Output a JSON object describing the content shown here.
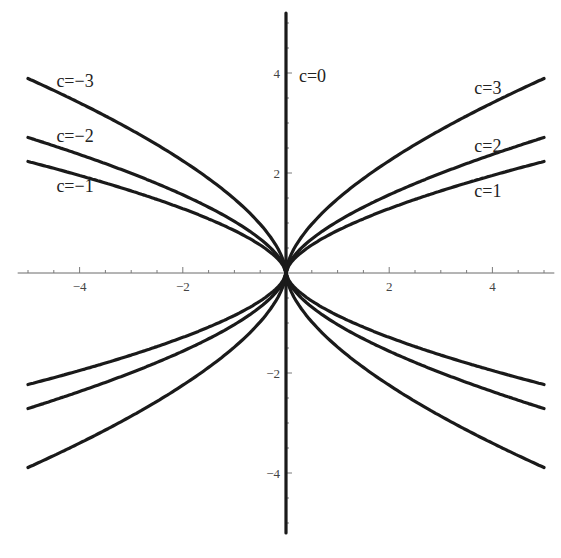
{
  "chart_data": {
    "type": "line",
    "title": "",
    "xlabel": "",
    "ylabel": "",
    "xlim": [
      -5.2,
      5.2
    ],
    "ylim": [
      -5.2,
      5.3
    ],
    "grid": false,
    "legend": "inline labels",
    "x_ticks": [
      {
        "value": -4,
        "label": "−4"
      },
      {
        "value": -2,
        "label": "−2"
      },
      {
        "value": 2,
        "label": "2"
      },
      {
        "value": 4,
        "label": "4"
      }
    ],
    "y_ticks": [
      {
        "value": 4,
        "label": "4"
      },
      {
        "value": 2,
        "label": "2"
      },
      {
        "value": -2,
        "label": "−2"
      },
      {
        "value": -4,
        "label": "−4"
      }
    ],
    "minor_tick_step": 0.5,
    "x_sample": [
      0,
      0.1,
      0.25,
      0.5,
      1,
      1.5,
      2,
      3,
      4,
      5
    ],
    "series": [
      {
        "name": "c=1",
        "c": 1,
        "branches": "±x, ±y",
        "values": [
          0,
          0.21,
          0.37,
          0.56,
          0.85,
          1.08,
          1.29,
          1.64,
          1.95,
          2.23
        ]
      },
      {
        "name": "c=2",
        "c": 2,
        "branches": "±x, ±y",
        "values": [
          0,
          0.26,
          0.45,
          0.68,
          1.03,
          1.31,
          1.56,
          1.99,
          2.37,
          2.71
        ]
      },
      {
        "name": "c=3",
        "c": 3,
        "branches": "±x, ±y",
        "values": [
          0,
          0.37,
          0.64,
          0.98,
          1.48,
          1.89,
          2.24,
          2.86,
          3.4,
          3.89
        ]
      },
      {
        "name": "c=0",
        "c": 0,
        "description": "vertical line x=0",
        "y_range": [
          -5.2,
          5.2
        ]
      }
    ],
    "annotations": [
      {
        "text": "c=−3",
        "x": -4.45,
        "y": 3.85
      },
      {
        "text": "c=−2",
        "x": -4.45,
        "y": 2.75
      },
      {
        "text": "c=−1",
        "x": -4.45,
        "y": 1.75
      },
      {
        "text": "c=0",
        "x": 0.25,
        "y": 3.95
      },
      {
        "text": "c=3",
        "x": 3.65,
        "y": 3.7
      },
      {
        "text": "c=2",
        "x": 3.65,
        "y": 2.55
      },
      {
        "text": "c=1",
        "x": 3.65,
        "y": 1.65
      }
    ]
  },
  "colors": {
    "curve": "#1a1a1a",
    "axis": "#6a6a6a",
    "background": "#ffffff"
  }
}
